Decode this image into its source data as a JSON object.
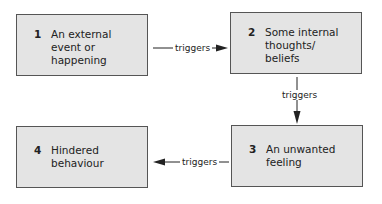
{
  "diagram": {
    "type": "flow",
    "nodes": [
      {
        "id": 1,
        "number": "1",
        "text": "An external\nevent or\nhappening"
      },
      {
        "id": 2,
        "number": "2",
        "text": "Some internal\nthoughts/\nbeliefs"
      },
      {
        "id": 3,
        "number": "3",
        "text": "An unwanted\nfeeling"
      },
      {
        "id": 4,
        "number": "4",
        "text": "Hindered\nbehaviour"
      }
    ],
    "edges": [
      {
        "from": 1,
        "to": 2,
        "label": "triggers"
      },
      {
        "from": 2,
        "to": 3,
        "label": "triggers"
      },
      {
        "from": 3,
        "to": 4,
        "label": "triggers"
      }
    ]
  },
  "colors": {
    "box_fill": "#e4e4e4",
    "box_border": "#555555",
    "line": "#222222"
  }
}
